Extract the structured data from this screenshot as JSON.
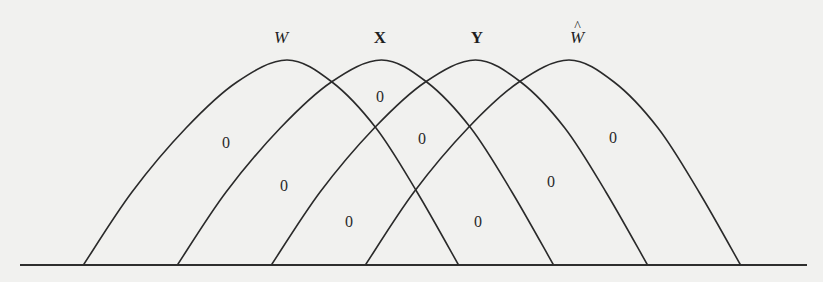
{
  "diagram": {
    "curve_labels": [
      {
        "id": "W",
        "text": "W",
        "style": "italic",
        "hat": false,
        "x": 281,
        "y": 37
      },
      {
        "id": "X",
        "text": "X",
        "style": "bold",
        "hat": false,
        "x": 380,
        "y": 37
      },
      {
        "id": "Y",
        "text": "Y",
        "style": "bold",
        "hat": false,
        "x": 477,
        "y": 37
      },
      {
        "id": "W-hat",
        "text": "W",
        "style": "italic",
        "hat": true,
        "hat_glyph": "^",
        "x": 577,
        "y": 37
      }
    ],
    "curves": [
      {
        "label": "W",
        "start_x": 84,
        "peak_x": 287,
        "end_x": 458
      },
      {
        "label": "X",
        "start_x": 178,
        "peak_x": 382,
        "end_x": 553
      },
      {
        "label": "Y",
        "start_x": 272,
        "peak_x": 477,
        "end_x": 647
      },
      {
        "label": "W-hat",
        "start_x": 366,
        "peak_x": 572,
        "end_x": 740
      }
    ],
    "peak_y": 60,
    "baseline": {
      "y": 265,
      "x_start": 20,
      "x_end": 807
    },
    "region_values": [
      {
        "text": "0",
        "x": 226,
        "y": 143
      },
      {
        "text": "0",
        "x": 284,
        "y": 186
      },
      {
        "text": "0",
        "x": 349,
        "y": 222
      },
      {
        "text": "0",
        "x": 380,
        "y": 97
      },
      {
        "text": "0",
        "x": 422,
        "y": 139
      },
      {
        "text": "0",
        "x": 478,
        "y": 222
      },
      {
        "text": "0",
        "x": 551,
        "y": 182
      },
      {
        "text": "0",
        "x": 613,
        "y": 138
      }
    ],
    "colors": {
      "background": "#f1f1ef",
      "stroke": "#2a2a2a",
      "text": "#1e1e1e"
    }
  }
}
